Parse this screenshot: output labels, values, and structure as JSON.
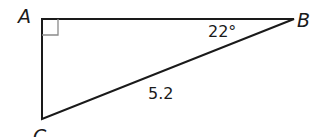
{
  "diagram": {
    "type": "right-triangle",
    "colors": {
      "stroke": "#1a1a1a",
      "right_angle_marker": "#8a8a8a",
      "background": "#ffffff"
    },
    "vertices": {
      "A": {
        "label": "A",
        "x": 42,
        "y": 19
      },
      "B": {
        "label": "B",
        "x": 294,
        "y": 19
      },
      "C": {
        "label": "C",
        "x": 42,
        "y": 119
      }
    },
    "angle_B": {
      "label": "22°"
    },
    "hypotenuse_BC": {
      "label": "5.2"
    },
    "right_angle_at": "A"
  }
}
